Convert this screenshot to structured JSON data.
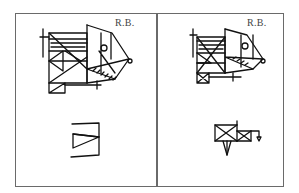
{
  "figure": {
    "type": "hand-drawn complex figure reproductions",
    "panels": [
      {
        "id": "left",
        "initials": "R.B.",
        "drawings": [
          {
            "position": "top",
            "description": "copy of complex figure (full)"
          },
          {
            "position": "bottom",
            "description": "recall fragment: rectangle with triangle"
          }
        ]
      },
      {
        "id": "right",
        "initials": "R.B.",
        "drawings": [
          {
            "position": "top",
            "description": "copy of complex figure (full)"
          },
          {
            "position": "bottom",
            "description": "recall fragment: crossed rectangles with triangle and appendage"
          }
        ]
      }
    ]
  },
  "colors": {
    "frame": "#6a6a6a",
    "ink": "#111111",
    "label": "#444444",
    "background": "#ffffff"
  }
}
